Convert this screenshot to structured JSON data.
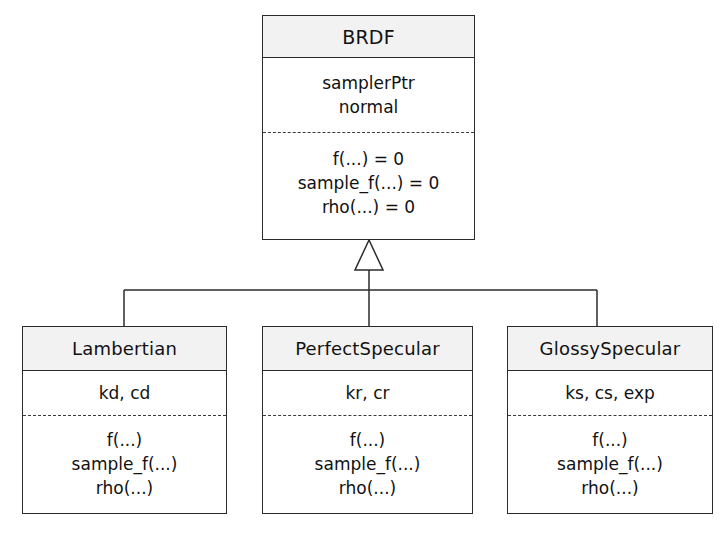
{
  "diagram": {
    "type": "uml-class-diagram",
    "relationship": "generalization",
    "colors": {
      "background": "#ffffff",
      "header_fill": "#f2f2f2",
      "body_fill": "#ffffff",
      "stroke": "#2b2b2b",
      "text": "#111111"
    },
    "parent": {
      "name": "BRDF",
      "attributes": [
        "samplerPtr",
        "normal"
      ],
      "methods": [
        "f(...) = 0",
        "sample_f(...) = 0",
        "rho(...) = 0"
      ]
    },
    "children": [
      {
        "name": "Lambertian",
        "attributes": [
          "kd, cd"
        ],
        "methods": [
          "f(...)",
          "sample_f(...)",
          "rho(...)"
        ]
      },
      {
        "name": "PerfectSpecular",
        "attributes": [
          "kr, cr"
        ],
        "methods": [
          "f(...)",
          "sample_f(...)",
          "rho(...)"
        ]
      },
      {
        "name": "GlossySpecular",
        "attributes": [
          "ks, cs, exp"
        ],
        "methods": [
          "f(...)",
          "sample_f(...)",
          "rho(...)"
        ]
      }
    ]
  }
}
